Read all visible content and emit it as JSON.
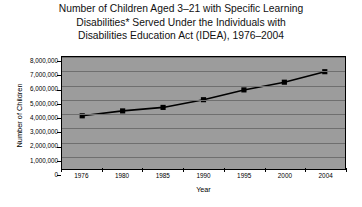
{
  "title": {
    "lines": [
      "Number of Children Aged 3–21 with Specific Learning",
      "Disabilities* Served Under the Individuals with",
      "Disabilities Education Act (IDEA), 1976–2004"
    ]
  },
  "chart_data": {
    "type": "line",
    "title": "Number of Children Aged 3–21 with Specific Learning Disabilities* Served Under the Individuals with Disabilities Education Act (IDEA), 1976–2004",
    "xlabel": "Year",
    "ylabel": "Number of Children",
    "categories": [
      "1976",
      "1980",
      "1985",
      "1990",
      "1995",
      "2000",
      "2004"
    ],
    "values": [
      3800000,
      4150000,
      4400000,
      4950000,
      5650000,
      6200000,
      6950000
    ],
    "ylim": [
      0,
      8000000
    ],
    "yticks": [
      "8,000,000",
      "7,000,000",
      "6,000,000",
      "5,000,000",
      "4,000,000",
      "3,000,000",
      "2,000,000",
      "1,000,000",
      "0"
    ],
    "ytick_values": [
      8000000,
      7000000,
      6000000,
      5000000,
      4000000,
      3000000,
      2000000,
      1000000,
      0
    ],
    "grid": true,
    "legend": false,
    "marker": "square",
    "line_color": "#000000",
    "marker_color": "#000000",
    "plot_background": "#9c9c9c",
    "gridline_color": "#6f6f6f"
  }
}
